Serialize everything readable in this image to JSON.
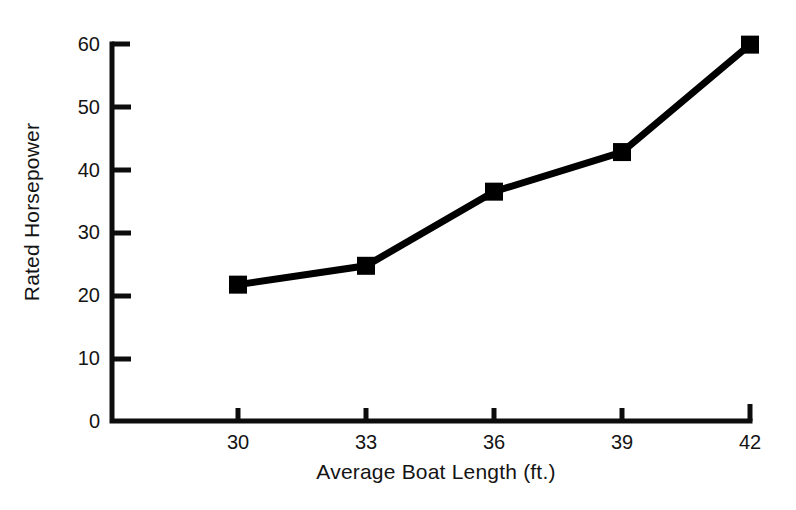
{
  "chart_data": {
    "type": "line",
    "title": "",
    "subtitle": "",
    "xlabel": "Average Boat Length (ft.)",
    "ylabel": "Rated Horsepower",
    "x": [
      30,
      33,
      36,
      39,
      42
    ],
    "values": [
      21.7,
      24.7,
      36.5,
      42.8,
      59.9
    ],
    "series": [
      {
        "name": "Rated Horsepower",
        "values": [
          21.7,
          24.7,
          36.5,
          42.8,
          59.9
        ]
      }
    ],
    "xlim": [
      30,
      42
    ],
    "ylim": [
      0,
      60
    ],
    "xticks": [
      30,
      33,
      36,
      39,
      42
    ],
    "yticks": [
      0,
      10,
      20,
      30,
      40,
      50,
      60
    ],
    "xtick_labels": [
      "30",
      "33",
      "36",
      "39",
      "42"
    ],
    "ytick_labels": [
      "0",
      "10",
      "20",
      "30",
      "40",
      "50",
      "60"
    ],
    "grid": false,
    "legend": false,
    "legend_position": "none",
    "marker": "filled-square",
    "line_color": "#000000",
    "marker_color": "#000000",
    "background_color": "#ffffff",
    "axis_color": "#000000",
    "line_width_px": 7,
    "marker_size_px": 18,
    "annotations": []
  }
}
